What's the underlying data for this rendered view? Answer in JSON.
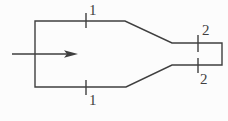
{
  "diagram": {
    "background_color": "#fcfcfc",
    "line_color": "#3f3f3f",
    "flow_arrow": {
      "direction": "right"
    },
    "sections": [
      {
        "id": "1",
        "top_label": "1",
        "bottom_label": "1"
      },
      {
        "id": "2",
        "top_label": "2",
        "bottom_label": "2"
      }
    ]
  }
}
